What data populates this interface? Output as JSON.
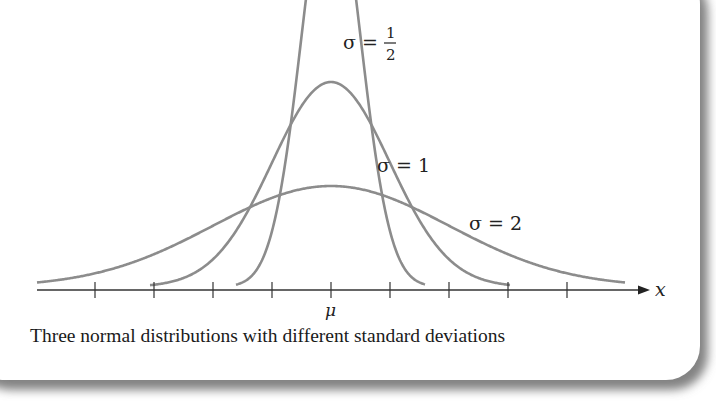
{
  "figure": {
    "caption": "Three normal distributions with different standard deviations",
    "axis_label": "x",
    "mean_label": "μ",
    "labels": {
      "sigma_half": {
        "lhs": "σ =",
        "num": "1",
        "den": "2"
      },
      "sigma_one": "σ = 1",
      "sigma_two": "σ = 2"
    }
  },
  "chart_data": {
    "type": "line",
    "title": "Three normal distributions with different standard deviations",
    "xlabel": "x",
    "ylabel": "",
    "x_tick_labels": [
      "",
      "",
      "",
      "",
      "μ",
      "",
      "",
      "",
      ""
    ],
    "x_ticks_relative_to_mu": [
      -4,
      -3,
      -2,
      -1,
      0,
      1,
      2,
      3,
      4
    ],
    "grid": false,
    "legend": "inline labels",
    "series": [
      {
        "name": "σ = 1/2",
        "mean": 0,
        "sd": 0.5,
        "relative_peak_height": 4
      },
      {
        "name": "σ = 1",
        "mean": 0,
        "sd": 1,
        "relative_peak_height": 2
      },
      {
        "name": "σ = 2",
        "mean": 0,
        "sd": 2,
        "relative_peak_height": 1
      }
    ],
    "colors": {
      "curves": "#8c8c8c",
      "axis": "#333333"
    }
  }
}
